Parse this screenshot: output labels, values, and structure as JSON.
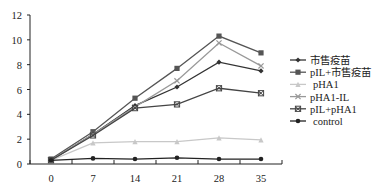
{
  "chart_data": {
    "type": "line",
    "title": "",
    "xlabel": "",
    "ylabel": "",
    "ylim": [
      0,
      12
    ],
    "yticks": [
      0,
      2,
      4,
      6,
      8,
      10,
      12
    ],
    "categories": [
      "0",
      "7",
      "14",
      "21",
      "28",
      "35"
    ],
    "grid": false,
    "legend_position": "right",
    "series": [
      {
        "name": "市售疫苗",
        "color": "#333333",
        "marker": "diamond",
        "values": [
          0.3,
          2.4,
          4.7,
          6.2,
          8.2,
          7.5
        ]
      },
      {
        "name": "pIL+市售疫苗",
        "color": "#555555",
        "marker": "square",
        "values": [
          0.4,
          2.6,
          5.3,
          7.7,
          10.3,
          8.95
        ]
      },
      {
        "name": "pHA1",
        "color": "#c8c8c8",
        "marker": "triangle",
        "values": [
          0.3,
          1.7,
          1.8,
          1.8,
          2.1,
          1.95
        ]
      },
      {
        "name": "pHA1-IL",
        "color": "#999999",
        "marker": "x",
        "values": [
          0.3,
          2.4,
          4.6,
          6.7,
          9.75,
          7.9
        ]
      },
      {
        "name": "pIL+pHA1",
        "color": "#444444",
        "marker": "x-square",
        "values": [
          0.3,
          2.3,
          4.5,
          4.8,
          6.1,
          5.7
        ]
      },
      {
        "name": "control",
        "color": "#222222",
        "marker": "circle",
        "values": [
          0.3,
          0.45,
          0.4,
          0.5,
          0.4,
          0.4
        ]
      }
    ]
  }
}
